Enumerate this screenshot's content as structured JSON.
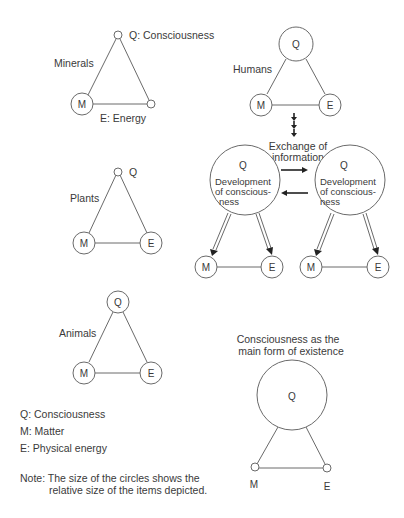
{
  "minerals": {
    "title": "Minerals",
    "q_label": "Q: Consciousness",
    "m_label": "M",
    "e_label": "E: Energy"
  },
  "plants": {
    "title": "Plants",
    "q_label": "Q",
    "m_label": "M",
    "e_label": "E"
  },
  "animals": {
    "title": "Animals",
    "q_label": "Q",
    "m_label": "M",
    "e_label": "E"
  },
  "humans": {
    "title": "Humans",
    "q_label": "Q",
    "m_label": "M",
    "e_label": "E",
    "exchange_line1": "Exchange of",
    "exchange_line2": "information",
    "left_node": {
      "q_label": "Q",
      "dev_line1": "Development",
      "dev_line2": "of conscious-",
      "dev_line3": "ness",
      "m_label": "M",
      "e_label": "E"
    },
    "right_node": {
      "q_label": "Q",
      "dev_line1": "Development",
      "dev_line2": "of conscious-",
      "dev_line3": "ness",
      "m_label": "M",
      "e_label": "E"
    }
  },
  "main_form": {
    "title_line1": "Consciousness as the",
    "title_line2": "main form of existence",
    "q_label": "Q",
    "m_label": "M",
    "e_label": "E"
  },
  "legend": {
    "q": "Q: Consciousness",
    "m": "M: Matter",
    "e": "E: Physical energy",
    "note_line1": "Note: The size of the circles shows the",
    "note_line2": "relative size of the items depicted."
  }
}
